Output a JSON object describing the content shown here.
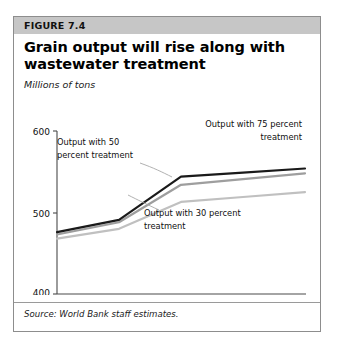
{
  "figure": {
    "number_label": "FIGURE 7.4",
    "title_line1": "Grain output will rise along with",
    "title_line2": "wastewater treatment",
    "units_label": "Millions of tons",
    "source_note": "Source: World Bank staff estimates."
  },
  "colors": {
    "banner_bg": "#c6c6c6",
    "card_border": "#8d8d8d",
    "series_75": "#1a1a1a",
    "series_50": "#9e9e9e",
    "series_30": "#c0c0c0",
    "axis": "#4a4a4a",
    "text": "#101010"
  },
  "annotations": {
    "a50_line1": "Output with 50",
    "a50_line2": "percent treatment",
    "a75_line1": "Output with 75 percent",
    "a75_line2": "treatment",
    "a30_line1": "Output with 30 percent",
    "a30_line2": "treatment"
  },
  "chart_data": {
    "type": "line",
    "title": "Grain output will rise along with wastewater treatment",
    "subtitle": "Millions of tons",
    "xlabel": "",
    "ylabel": "Millions of tons",
    "x": [
      2000,
      2005,
      2010,
      2015,
      2020
    ],
    "xtick_labels": [
      "2000",
      "2005",
      "2010",
      "2015",
      "2020"
    ],
    "ytick_labels": [
      "400",
      "500",
      "600"
    ],
    "yticks": [
      400,
      500,
      600
    ],
    "ylim": [
      400,
      600
    ],
    "xlim": [
      2000,
      2020
    ],
    "grid": false,
    "legend": "annotations",
    "source": "World Bank staff estimates.",
    "series": [
      {
        "name": "Output with 75 percent treatment",
        "color": "#1a1a1a",
        "values": [
          476,
          491,
          544,
          549,
          554
        ]
      },
      {
        "name": "Output with 50 percent treatment",
        "color": "#9e9e9e",
        "values": [
          473,
          488,
          534,
          541,
          548
        ]
      },
      {
        "name": "Output with 30 percent treatment",
        "color": "#c0c0c0",
        "values": [
          468,
          480,
          513,
          519,
          525
        ]
      }
    ]
  }
}
